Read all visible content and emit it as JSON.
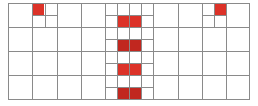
{
  "board": {
    "line_color": "#8a8a8a",
    "fill_colors": {
      "red": "#dc3228",
      "dark_red": "#c1271f"
    },
    "bounds": {
      "left": 8,
      "top": 3,
      "right": 249,
      "bottom": 99
    },
    "columns_x": [
      8,
      32,
      57,
      81,
      105,
      129,
      153,
      178,
      202,
      226,
      249
    ],
    "rows_y": [
      3,
      27,
      51,
      75,
      99
    ],
    "subdivisions": [
      {
        "name": "top-left-quad",
        "x": 32,
        "y": 3,
        "w": 25,
        "h": 24
      },
      {
        "name": "top-right-quad",
        "x": 202,
        "y": 3,
        "w": 24,
        "h": 24
      },
      {
        "name": "center-column",
        "x": 105,
        "y": 3,
        "w": 48,
        "h": 96
      }
    ],
    "filled_cells": [
      {
        "name": "filled-cell-top-left",
        "x": 32,
        "y": 3,
        "w": 12,
        "h": 12,
        "color": "red"
      },
      {
        "name": "filled-cell-top-right",
        "x": 214,
        "y": 3,
        "w": 12,
        "h": 12,
        "color": "red"
      },
      {
        "name": "filled-cell-center-1",
        "x": 117,
        "y": 15,
        "w": 24,
        "h": 12,
        "color": "red"
      },
      {
        "name": "filled-cell-center-2",
        "x": 117,
        "y": 39,
        "w": 24,
        "h": 12,
        "color": "dark_red"
      },
      {
        "name": "filled-cell-center-3",
        "x": 117,
        "y": 63,
        "w": 24,
        "h": 12,
        "color": "red"
      },
      {
        "name": "filled-cell-center-4",
        "x": 117,
        "y": 87,
        "w": 24,
        "h": 12,
        "color": "dark_red"
      }
    ]
  }
}
